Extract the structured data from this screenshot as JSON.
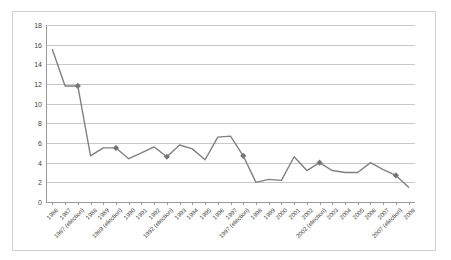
{
  "chart_data": {
    "type": "line",
    "title": "",
    "subtitle": "",
    "xlabel": "",
    "ylabel": "",
    "grid": true,
    "legend": false,
    "legend_position": "none",
    "ylim": [
      0,
      18
    ],
    "y_ticks": [
      0,
      2,
      4,
      6,
      8,
      10,
      12,
      14,
      16,
      18
    ],
    "y_tick_labels": [
      "0",
      "2",
      "4",
      "6",
      "8",
      "10",
      "12",
      "14",
      "16",
      "18"
    ],
    "line_color": "#808080",
    "marker_color": "#757575",
    "marker_shape": "diamond",
    "categories": [
      "1986",
      "1987",
      "1987 (election)",
      "1988",
      "1989",
      "1989 (election)",
      "1990",
      "1991",
      "1992",
      "1992 (election)",
      "1993",
      "1994",
      "1995",
      "1996",
      "1997",
      "1997 (election)",
      "1998",
      "1999",
      "2000",
      "2001",
      "2002",
      "2002 (election)",
      "2003",
      "2004",
      "2005",
      "2006",
      "2007",
      "2007 (election)",
      "2008"
    ],
    "values": [
      15.5,
      11.8,
      11.8,
      4.7,
      5.5,
      5.5,
      4.4,
      5.0,
      5.6,
      4.6,
      5.8,
      5.4,
      4.3,
      6.6,
      6.7,
      4.7,
      2.0,
      2.3,
      2.2,
      4.6,
      3.2,
      4.0,
      3.2,
      3.0,
      3.0,
      4.0,
      3.3,
      2.7,
      1.5
    ],
    "marker_categories": [
      "1987 (election)",
      "1989 (election)",
      "1992 (election)",
      "1997 (election)",
      "2002 (election)",
      "2007 (election)"
    ]
  }
}
